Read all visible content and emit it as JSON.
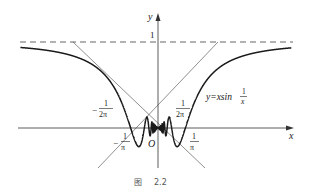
{
  "figure": {
    "caption_prefix": "图",
    "caption_number": "2.2",
    "function_label": "y=xsin",
    "function_frac_num": "1",
    "function_frac_den": "x",
    "axis_x_label": "x",
    "axis_y_label": "y",
    "origin_label": "O",
    "asymptote_value_label": "1",
    "tick_labels": {
      "neg_inv_2pi": {
        "sign": "−",
        "num": "1",
        "den": "2π"
      },
      "pos_inv_2pi": {
        "sign": "",
        "num": "1",
        "den": "2π"
      },
      "neg_inv_pi": {
        "sign": "−",
        "num": "1",
        "den": "π"
      },
      "pos_inv_pi": {
        "sign": "",
        "num": "1",
        "den": "π"
      }
    },
    "colors": {
      "curve": "#1a1a1a",
      "axes": "#333333",
      "guide": "#444444",
      "dashed": "#555555"
    },
    "scale_px_per_unit": 86,
    "origin_px": [
      158,
      128
    ],
    "x_range": [
      -1.6,
      1.55
    ]
  }
}
